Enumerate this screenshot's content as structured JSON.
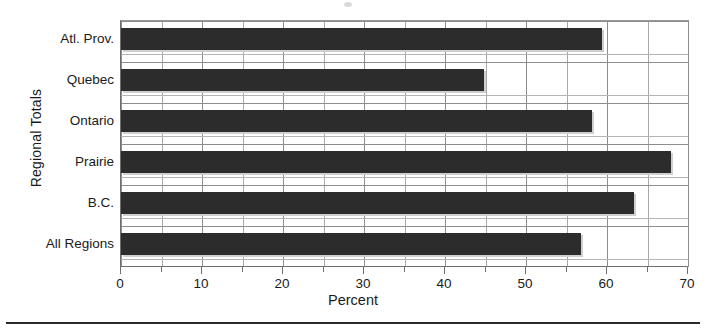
{
  "chart_data": {
    "type": "bar",
    "orientation": "horizontal",
    "title": "",
    "xlabel": "Percent",
    "ylabel": "Regional Totals",
    "categories": [
      "Atl. Prov.",
      "Quebec",
      "Ontario",
      "Prairie",
      "B.C.",
      "All Regions"
    ],
    "values": [
      59.4,
      44.8,
      58.1,
      67.9,
      63.3,
      56.8
    ],
    "xlim": [
      0,
      70
    ],
    "xticks": [
      0,
      10,
      20,
      30,
      40,
      50,
      60,
      70
    ],
    "xtick_labels": [
      "0",
      "10",
      "20",
      "30",
      "40",
      "50",
      "60",
      "70"
    ],
    "minor_tick_step": 5,
    "grid": "vertical-major-and-minor, horizontal-category",
    "legend": "none",
    "bar_color": "#2c2c2c",
    "shadow_color": "#cfcfcf",
    "grid_color": "#8d8d8d",
    "axis_color": "#6e6e6e"
  },
  "axes": {
    "y_title": "Regional Totals",
    "x_title": "Percent"
  }
}
